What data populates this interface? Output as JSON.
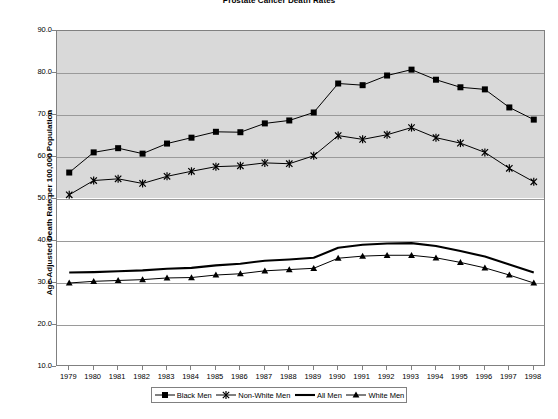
{
  "chart_data": {
    "type": "line",
    "title": "Prostate Cancer Death Rates",
    "xlabel": "",
    "ylabel": "Age-Adjusted Death Rate per 100,000 Population",
    "xlim": [
      1979,
      1998
    ],
    "ylim": [
      10.0,
      90.0
    ],
    "ytick_step": 10.0,
    "grid": true,
    "legend_position": "bottom",
    "categories": [
      1979,
      1980,
      1981,
      1982,
      1983,
      1984,
      1985,
      1986,
      1987,
      1988,
      1989,
      1990,
      1991,
      1992,
      1993,
      1994,
      1995,
      1996,
      1997,
      1998
    ],
    "x_tick_labels": [
      "1979",
      "1980",
      "1981",
      "1982",
      "1983",
      "1984",
      "1985",
      "1986",
      "1987",
      "1988",
      "1989",
      "1990",
      "1991",
      "1992",
      "1993",
      "1994",
      "1995",
      "1996",
      "1997",
      "1998"
    ],
    "y_tick_labels": [
      "90.0",
      "80.0",
      "70.0",
      "60.0",
      "50.0",
      "40.0",
      "30.0",
      "20.0",
      "10.0"
    ],
    "y_tick_values": [
      90.0,
      80.0,
      70.0,
      60.0,
      50.0,
      40.0,
      30.0,
      20.0,
      10.0
    ],
    "series": [
      {
        "name": "Black Men",
        "marker": "square",
        "color": "#000000",
        "values": [
          56.3,
          61.1,
          62.1,
          60.8,
          63.2,
          64.6,
          66.0,
          65.9,
          68.0,
          68.7,
          70.6,
          77.5,
          77.1,
          79.4,
          80.8,
          78.4,
          76.6,
          76.1,
          71.8,
          68.9
        ]
      },
      {
        "name": "Non-White Men",
        "marker": "x",
        "color": "#000000",
        "values": [
          51.0,
          54.4,
          54.8,
          53.7,
          55.4,
          56.6,
          57.7,
          57.9,
          58.6,
          58.4,
          60.3,
          65.1,
          64.2,
          65.3,
          67.0,
          64.6,
          63.3,
          61.1,
          57.3,
          54.1
        ]
      },
      {
        "name": "All Men",
        "marker": "none",
        "color": "#000000",
        "values": [
          32.5,
          32.6,
          32.8,
          33.0,
          33.4,
          33.6,
          34.2,
          34.6,
          35.3,
          35.6,
          36.0,
          38.4,
          39.1,
          39.4,
          39.5,
          38.8,
          37.6,
          36.3,
          34.4,
          32.5
        ]
      },
      {
        "name": "White Men",
        "marker": "triangle",
        "color": "#000000",
        "values": [
          30.0,
          30.4,
          30.6,
          30.8,
          31.2,
          31.3,
          31.9,
          32.2,
          32.9,
          33.2,
          33.5,
          35.9,
          36.4,
          36.6,
          36.6,
          36.0,
          34.9,
          33.6,
          31.9,
          30.0
        ]
      }
    ]
  },
  "legend": {
    "items": [
      {
        "label": "Black Men",
        "marker": "square"
      },
      {
        "label": "Non-White Men",
        "marker": "x"
      },
      {
        "label": "All Men",
        "marker": "none"
      },
      {
        "label": "White Men",
        "marker": "triangle"
      }
    ]
  }
}
